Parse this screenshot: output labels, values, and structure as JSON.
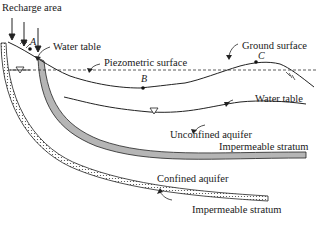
{
  "diagram": {
    "labels": {
      "recharge_area": "Recharge area",
      "water_table_top": "Water table",
      "piezometric_surface": "Piezometric surface",
      "ground_surface": "Ground surface",
      "water_table_mid": "Water table",
      "unconfined_aquifer": "Unconfined aquifer",
      "impermeable_stratum_upper": "Impermeable stratum",
      "confined_aquifer": "Confined aquifer",
      "impermeable_stratum_lower": "Impermeable stratum"
    },
    "points": {
      "a": "A",
      "b": "B",
      "c": "C"
    },
    "colors": {
      "stratum_fill": "#b5b5b5",
      "line": "#222222",
      "background": "#ffffff"
    }
  }
}
